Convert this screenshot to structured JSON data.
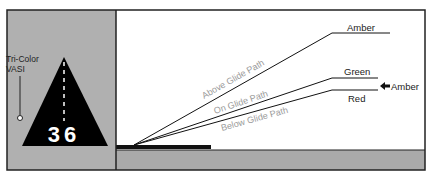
{
  "left_panel": {
    "label_line1": "Tri-Color",
    "label_line2": "VASI",
    "runway_number": "36"
  },
  "right_panel": {
    "paths": [
      {
        "name": "Above Glide Path",
        "light": "Amber"
      },
      {
        "name": "On Glide Path",
        "light": "Green"
      },
      {
        "name": "Below Glide Path",
        "light": "Red"
      }
    ],
    "transition_light": "Amber"
  },
  "colors": {
    "ground": "#aaaaaa",
    "panel_bg": "#b0b0b0",
    "path_label": "#9a9a9a",
    "line": "#111111"
  }
}
